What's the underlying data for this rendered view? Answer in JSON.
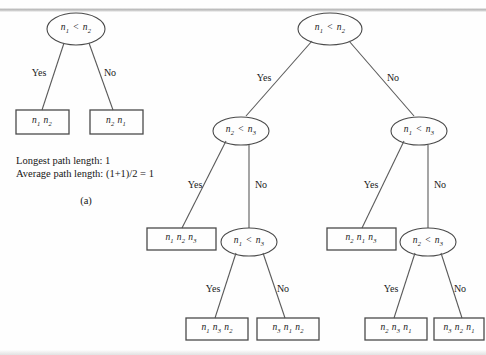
{
  "figure": {
    "caption_lines": [
      "Longest path length: 1",
      "Average path length: (1+1)/2 = 1"
    ],
    "part_label": "(a)"
  },
  "labels": {
    "yes": "Yes",
    "no": "No"
  },
  "tree_a": {
    "root": {
      "left": "n",
      "left_sub": "1",
      "op": "<",
      "right": "n",
      "right_sub": "2"
    },
    "root_text": "n1 < n2",
    "leaves": [
      {
        "text": "n1 n2"
      },
      {
        "text": "n2 n1"
      }
    ]
  },
  "tree_b": {
    "root_text": "n1 < n2",
    "level2": [
      {
        "text": "n2 < n3"
      },
      {
        "text": "n1 < n3"
      }
    ],
    "level3_leaves": [
      {
        "text": "n1 n2 n3"
      },
      {
        "text": "n2 n1 n3"
      }
    ],
    "level3_nodes": [
      {
        "text": "n1 < n3"
      },
      {
        "text": "n2 < n3"
      }
    ],
    "level4_leaves": [
      {
        "text": "n1 n3 n2"
      },
      {
        "text": "n3 n1 n2"
      },
      {
        "text": "n2 n3 n1"
      },
      {
        "text": "n3 n2 n1"
      }
    ]
  },
  "colors": {
    "stroke": "#4a4a4a",
    "line": "#5a5a5a",
    "text": "#1a1a1a",
    "background": "#fefefe"
  }
}
